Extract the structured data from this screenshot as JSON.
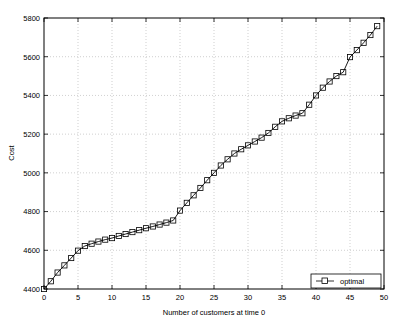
{
  "chart_data": {
    "type": "line",
    "title": "",
    "xlabel": "Number of customers at time 0",
    "ylabel": "Cost",
    "xlim": [
      0,
      50
    ],
    "ylim": [
      4400,
      5800
    ],
    "xticks": [
      0,
      5,
      10,
      15,
      20,
      25,
      30,
      35,
      40,
      45,
      50
    ],
    "xtick_labels": [
      "0",
      "5",
      "10",
      "15",
      "20",
      "25",
      "30",
      "35",
      "40",
      "45",
      "50"
    ],
    "yticks": [
      4400,
      4600,
      4800,
      5000,
      5200,
      5400,
      5600,
      5800
    ],
    "ytick_labels": [
      "4400",
      "4600",
      "4800",
      "5000",
      "5200",
      "5400",
      "5600",
      "5800"
    ],
    "grid": true,
    "grid_style": "dotted",
    "legend": {
      "position": "lower-right",
      "entries": [
        {
          "name": "optimal",
          "marker": "square",
          "line": "solid",
          "color": "#000000"
        }
      ]
    },
    "series": [
      {
        "name": "optimal",
        "marker": "square",
        "color": "#000000",
        "x": [
          0,
          1,
          2,
          3,
          4,
          5,
          6,
          7,
          8,
          9,
          10,
          11,
          12,
          13,
          14,
          15,
          16,
          17,
          18,
          19,
          20,
          21,
          22,
          23,
          24,
          25,
          26,
          27,
          28,
          29,
          30,
          31,
          32,
          33,
          34,
          35,
          36,
          37,
          38,
          39,
          40,
          41,
          42,
          43,
          44,
          45,
          46,
          47,
          48,
          49
        ],
        "values": [
          4400,
          4440,
          4485,
          4522,
          4560,
          4598,
          4622,
          4634,
          4645,
          4655,
          4663,
          4674,
          4684,
          4694,
          4704,
          4714,
          4723,
          4733,
          4743,
          4754,
          4805,
          4845,
          4884,
          4922,
          4962,
          5000,
          5038,
          5070,
          5100,
          5122,
          5142,
          5162,
          5182,
          5206,
          5238,
          5266,
          5282,
          5296,
          5308,
          5352,
          5400,
          5440,
          5472,
          5500,
          5520,
          5598,
          5634,
          5672,
          5712,
          5758
        ]
      }
    ]
  },
  "axes": {
    "ylabel_text": "Cost",
    "xlabel_text": "Number of customers at time 0"
  },
  "legend": {
    "optimal_label": "optimal"
  }
}
